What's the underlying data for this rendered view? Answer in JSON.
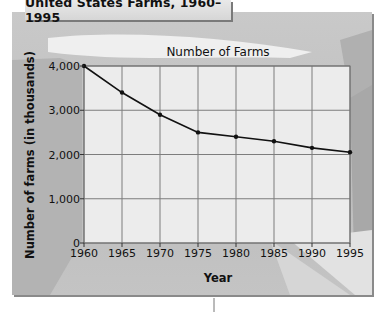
{
  "title_box": {
    "label": "United States Farms, 1960–1995"
  },
  "chart_data": {
    "type": "line",
    "title": "Number of Farms",
    "xlabel": "Year",
    "ylabel": "Number of farms (in thousands)",
    "x": [
      1960,
      1965,
      1970,
      1975,
      1980,
      1985,
      1990,
      1995
    ],
    "series": [
      {
        "name": "Number of Farms",
        "values": [
          4000,
          3400,
          2900,
          2500,
          2400,
          2300,
          2150,
          2050
        ]
      }
    ],
    "x_tick_labels": [
      "1960",
      "1965",
      "1970",
      "1975",
      "1980",
      "1985",
      "1990",
      "1995"
    ],
    "y_tick_labels": [
      "0",
      "1,000",
      "2,000",
      "3,000",
      "4,000"
    ],
    "y_ticks": [
      0,
      1000,
      2000,
      3000,
      4000
    ],
    "ylim": [
      0,
      4000
    ],
    "xlim": [
      1960,
      1995
    ],
    "grid": true,
    "legend": "none",
    "colors": {
      "line": "#111111",
      "grid": "#7a7a7a",
      "plot_bg": "#ececec",
      "frame_bg": "#c4c4c4"
    }
  }
}
